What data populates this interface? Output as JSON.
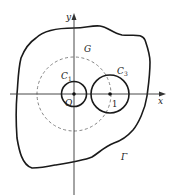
{
  "diagram": {
    "type": "complex-plane-contours",
    "axes": {
      "x_label": "x",
      "y_label": "y",
      "origin_label": "O"
    },
    "labels": {
      "region": "G",
      "contour_inner": "C",
      "contour_inner_sub": "1",
      "contour_right": "C",
      "contour_right_sub": "3",
      "outer_boundary": "Γ",
      "tick_one": "1"
    },
    "colors": {
      "stroke": "#1a1a1a",
      "dashed": "#777777",
      "text": "#222222"
    }
  }
}
